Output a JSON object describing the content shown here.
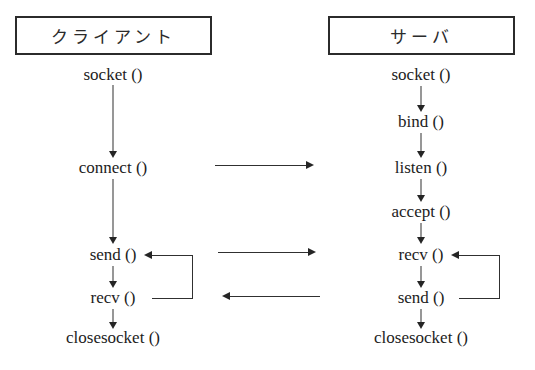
{
  "diagram": {
    "title_client": "クライアント",
    "title_server": "サーバ",
    "client": {
      "header": "クライアント",
      "steps": [
        {
          "label": "socket ()",
          "y": 75
        },
        {
          "label": "connect ()",
          "y": 168
        },
        {
          "label": "send ()",
          "y": 255
        },
        {
          "label": "recv ()",
          "y": 298
        },
        {
          "label": "closesocket ()",
          "y": 338
        }
      ],
      "loop": {
        "from": "recv ()",
        "to": "send ()",
        "direction": "up"
      }
    },
    "server": {
      "header": "サーバ",
      "steps": [
        {
          "label": "socket ()",
          "y": 75
        },
        {
          "label": "bind ()",
          "y": 122
        },
        {
          "label": "listen ()",
          "y": 168
        },
        {
          "label": "accept ()",
          "y": 212
        },
        {
          "label": "recv ()",
          "y": 255
        },
        {
          "label": "send ()",
          "y": 298
        },
        {
          "label": "closesocket ()",
          "y": 338
        }
      ],
      "loop": {
        "from": "send ()",
        "to": "recv ()",
        "direction": "up"
      }
    },
    "connections": [
      {
        "name": "connect-to-listen",
        "from": "connect ()",
        "to": "listen ()",
        "direction": "right",
        "y": 165
      },
      {
        "name": "client-send-to-server-recv",
        "from": "send ()",
        "to": "recv ()",
        "direction": "right",
        "y": 252
      },
      {
        "name": "server-send-to-client-recv",
        "from": "send ()",
        "to": "recv ()",
        "direction": "left",
        "y": 296
      }
    ],
    "colors": {
      "background": "#ffffff",
      "line": "#303030",
      "text": "#1c1c1c",
      "box_border": "#2b2b2b"
    }
  }
}
